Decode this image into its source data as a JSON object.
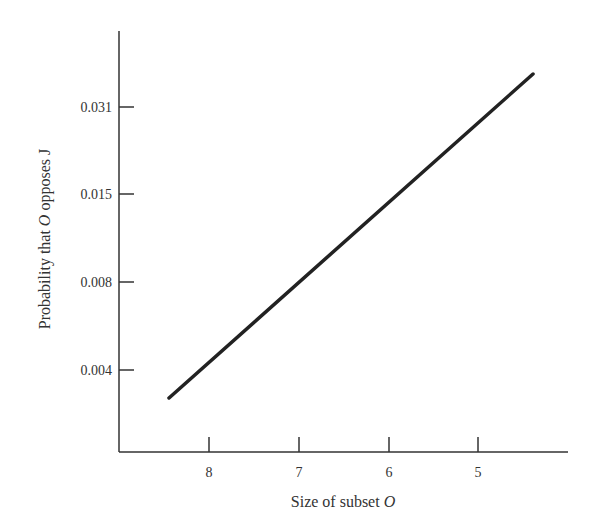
{
  "chart_data": {
    "type": "line",
    "title": "",
    "xlabel": "Size of subset O",
    "xlabel_parts": {
      "text": "Size of subset ",
      "italic": "O"
    },
    "ylabel": "Probability that O opposes J",
    "ylabel_parts": {
      "before": "Probability that ",
      "italic": "O",
      "after": " opposes J"
    },
    "x_ticks": [
      {
        "label": "8",
        "px": 209
      },
      {
        "label": "7",
        "px": 299
      },
      {
        "label": "6",
        "px": 389
      },
      {
        "label": "5",
        "px": 478
      }
    ],
    "y_ticks": [
      {
        "label": "0.031",
        "py": 107
      },
      {
        "label": "0.015",
        "py": 194
      },
      {
        "label": "0.008",
        "py": 282
      },
      {
        "label": "0.004",
        "py": 370
      }
    ],
    "x_axis_reversed": true,
    "y_scale": "log",
    "grid": false,
    "legend": null,
    "series": [
      {
        "name": "Probability that O opposes J",
        "x": [
          8.44,
          4.39
        ],
        "y": [
          0.0027,
          0.052
        ],
        "color": "#222222"
      }
    ]
  }
}
